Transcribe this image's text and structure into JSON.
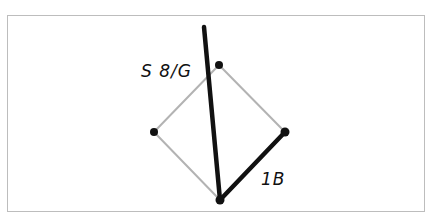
{
  "diagram": {
    "type": "geometric-figure",
    "colors": {
      "frame_border": "#bdbdbd",
      "thin_edge": "#b3b3b3",
      "thick_edge": "#111111",
      "vertex": "#111111",
      "label": "#111111"
    },
    "vertices": [
      {
        "id": "top",
        "x": 219,
        "y": 65
      },
      {
        "id": "left",
        "x": 154,
        "y": 132
      },
      {
        "id": "right",
        "x": 285,
        "y": 132
      },
      {
        "id": "bottom",
        "x": 220,
        "y": 200
      }
    ],
    "thin_edges": [
      {
        "from": "top",
        "to": "left"
      },
      {
        "from": "top",
        "to": "right"
      },
      {
        "from": "left",
        "to": "bottom"
      }
    ],
    "thick_edges": [
      {
        "id": "long-line",
        "x1": 204,
        "y1": 27,
        "x2": 220,
        "y2": 200
      },
      {
        "id": "bottom-right-edge",
        "from": "bottom",
        "to": "right"
      }
    ],
    "labels": [
      {
        "id": "label-s81g",
        "text": "S 8/G",
        "x": 141,
        "y": 76
      },
      {
        "id": "label-1b",
        "text": "1B",
        "x": 261,
        "y": 184
      }
    ]
  }
}
